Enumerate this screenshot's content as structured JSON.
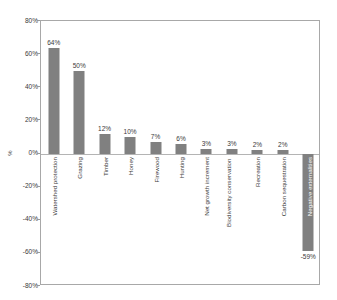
{
  "chart_data": {
    "type": "bar",
    "title": "",
    "subtitle": "",
    "xlabel": "",
    "ylabel": "%",
    "ylim": [
      -80,
      80
    ],
    "grid": false,
    "legend": null,
    "orientation": "vertical",
    "bar_color": "#808080",
    "plot_border_color": "#a8a8a8",
    "zero_line_color": "#b4b4b4",
    "categories": [
      "Watershed protection",
      "Grazing",
      "Timber",
      "Honey",
      "Firewood",
      "Hunting",
      "Net growth increment",
      "Biodiversity conservation",
      "Recreation",
      "Carbon sequestration",
      "Negative externalities"
    ],
    "values": [
      64,
      50,
      12,
      10,
      7,
      6,
      3,
      3,
      2,
      2,
      -59
    ],
    "data_labels": [
      "64%",
      "50%",
      "12%",
      "10%",
      "7%",
      "6%",
      "3%",
      "3%",
      "2%",
      "2%",
      "-59%"
    ],
    "ytick_values": [
      80,
      60,
      40,
      20,
      0,
      -20,
      -40,
      -60,
      -80
    ],
    "ytick_labels": [
      "80%",
      "60%",
      "40%",
      "20%",
      "0%",
      "-20%",
      "-40%",
      "-60%",
      "-80%"
    ]
  }
}
